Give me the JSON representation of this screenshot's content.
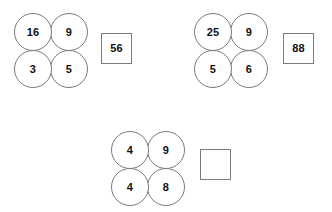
{
  "page": {
    "background_color": "#ffffff",
    "stroke_color": "#7b7b7b",
    "text_color": "#111111"
  },
  "groups": [
    {
      "id": "group-1",
      "circles": {
        "top_left": "16",
        "top_right": "9",
        "bottom_left": "3",
        "bottom_right": "5"
      },
      "answer": {
        "value": "56",
        "empty": false
      }
    },
    {
      "id": "group-2",
      "circles": {
        "top_left": "25",
        "top_right": "9",
        "bottom_left": "5",
        "bottom_right": "6"
      },
      "answer": {
        "value": "88",
        "empty": false
      }
    },
    {
      "id": "group-3",
      "circles": {
        "top_left": "4",
        "top_right": "9",
        "bottom_left": "4",
        "bottom_right": "8"
      },
      "answer": {
        "value": "",
        "empty": true
      }
    }
  ]
}
